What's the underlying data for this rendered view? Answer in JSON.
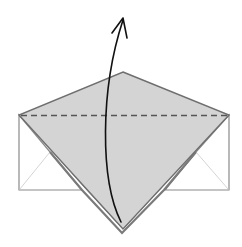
{
  "diagram": {
    "type": "origami-fold-step",
    "colors": {
      "paper_colored": "#d4d4d4",
      "paper_white": "#ffffff",
      "edge": "#6e6e6e",
      "crease_light": "#c8c8c8",
      "dashed_fold": "#555555",
      "arrow": "#111111"
    },
    "elements": {
      "fold_line": "dashed-valley-fold",
      "arrow": "fold-up-arrow"
    }
  }
}
